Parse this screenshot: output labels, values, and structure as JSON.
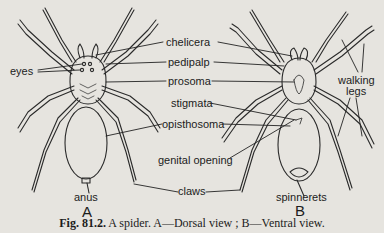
{
  "figure": {
    "caption_number": "Fig. 81.2.",
    "caption_text": " A spider. A—Dorsal view ; B—Ventral view.",
    "views": [
      {
        "letter": "A",
        "name": "Dorsal view"
      },
      {
        "letter": "B",
        "name": "Ventral view"
      }
    ],
    "labels": {
      "eyes": "eyes",
      "chelicera": "chelicera",
      "pedipalp": "pedipalp",
      "prosoma": "prosoma",
      "stigmata": "stigmata",
      "opisthosoma": "opisthosoma",
      "genital_opening": "genital opening",
      "claws": "claws",
      "anus": "anus",
      "spinnerets": "spinnerets",
      "walking_legs_1": "walking",
      "walking_legs_2": "legs"
    },
    "colors": {
      "background": "#e6e4df",
      "ink": "#1c1c1c"
    }
  }
}
